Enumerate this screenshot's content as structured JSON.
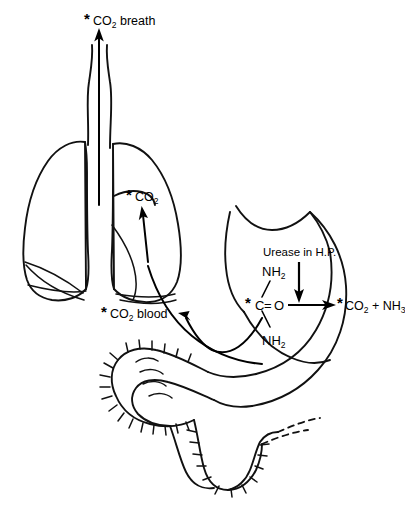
{
  "figure": {
    "background_color": "#ffffff",
    "line_color": "#111111"
  },
  "labels": {
    "co2_breath": {
      "marker": "*",
      "text": "CO",
      "subscript": "2",
      "suffix": " breath",
      "full": "*CO2 breath"
    },
    "co2_lung": {
      "marker": "*",
      "text": "CO",
      "subscript": "2",
      "suffix": "",
      "full": "*CO2"
    },
    "co2_blood": {
      "marker": "*",
      "text": "CO",
      "subscript": "2",
      "suffix": " blood",
      "full": "*CO2 blood"
    },
    "enzyme": {
      "full": "Urease in H.P."
    }
  },
  "reaction": {
    "substrate": {
      "amine_top": "NH",
      "amine_top_sub": "2",
      "amine_bottom": "NH",
      "amine_bottom_sub": "2",
      "carbon_marker": "*",
      "carbon": "C",
      "double_bond": "=",
      "oxygen": "O",
      "full": "*C=O with NH2 groups (urea)"
    },
    "catalyst": "Urease in H.P.",
    "products": {
      "marker": "*",
      "co2": "CO",
      "co2_sub": "2",
      "plus": "+",
      "nh3": "NH",
      "nh3_sub": "3",
      "full": "*CO2 + NH3"
    }
  },
  "anatomy": {
    "parts": [
      "trachea",
      "left-lung",
      "right-lung",
      "stomach",
      "duodenum",
      "small-intestine"
    ]
  }
}
